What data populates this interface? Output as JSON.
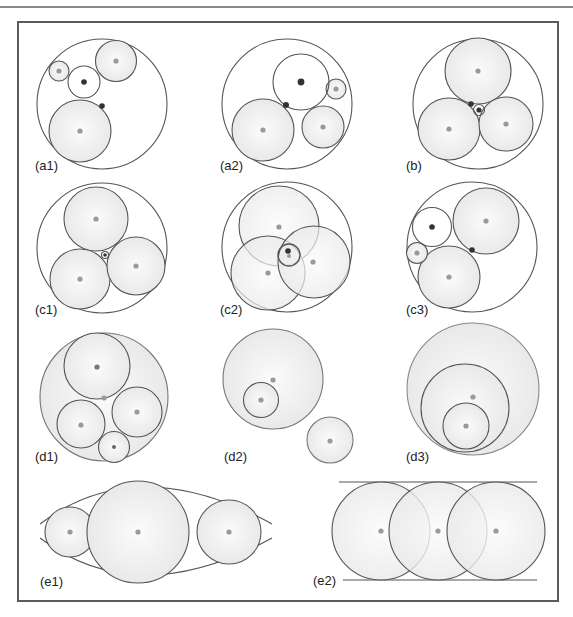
{
  "figure": {
    "panels": [
      {
        "id": "a1",
        "label": "(a1)"
      },
      {
        "id": "a2",
        "label": "(a2)"
      },
      {
        "id": "b",
        "label": "(b)"
      },
      {
        "id": "c1",
        "label": "(c1)"
      },
      {
        "id": "c2",
        "label": "(c2)"
      },
      {
        "id": "c3",
        "label": "(c3)"
      },
      {
        "id": "d1",
        "label": "(d1)"
      },
      {
        "id": "d2",
        "label": "(d2)"
      },
      {
        "id": "d3",
        "label": "(d3)"
      },
      {
        "id": "e1",
        "label": "(e1)"
      },
      {
        "id": "e2",
        "label": "(e2)"
      }
    ]
  },
  "colors": {
    "outline": "#555555",
    "fill": "#efefef",
    "center_gray": "#9a9a9a",
    "center_dark": "#333333",
    "frame": "#5a5a5a"
  }
}
